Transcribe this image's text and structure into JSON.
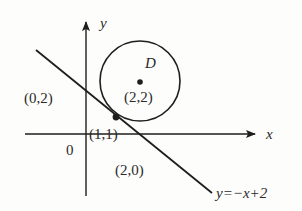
{
  "diagram": {
    "title": "",
    "axes": {
      "x_label": "x",
      "y_label": "y",
      "origin_label": "0"
    },
    "circle": {
      "name": "D",
      "center_label": "(2,2)",
      "center": [
        2,
        2
      ]
    },
    "line": {
      "equation_label": "y=−x+2",
      "slope": -1,
      "intercept": 2
    },
    "points": [
      {
        "label": "(0,2)",
        "coords": [
          0,
          2
        ],
        "role": "y-intercept of line"
      },
      {
        "label": "(1,1)",
        "coords": [
          1,
          1
        ],
        "role": "tangent point"
      },
      {
        "label": "(2,0)",
        "coords": [
          2,
          0
        ],
        "role": "x-intercept of line"
      }
    ],
    "colors": {
      "stroke": "#1e1e1e",
      "background": "#fdfdfb"
    }
  }
}
